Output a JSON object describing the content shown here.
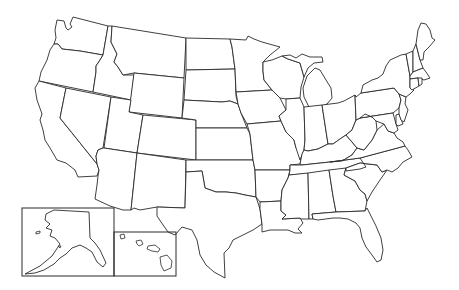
{
  "map": {
    "type": "blank-outline-map",
    "subject": "United States",
    "background_color": "#ffffff",
    "stroke_color": "#2a2a2a",
    "labels_visible": false,
    "insets": [
      {
        "name": "Alaska",
        "frame": [
          22,
          208,
          92,
          68
        ]
      },
      {
        "name": "Hawaii",
        "frame": [
          114,
          232,
          62,
          44
        ]
      }
    ],
    "states": [
      "Washington",
      "Oregon",
      "California",
      "Idaho",
      "Nevada",
      "Montana",
      "Wyoming",
      "Utah",
      "Arizona",
      "Colorado",
      "New Mexico",
      "North Dakota",
      "South Dakota",
      "Nebraska",
      "Kansas",
      "Oklahoma",
      "Texas",
      "Minnesota",
      "Iowa",
      "Missouri",
      "Arkansas",
      "Louisiana",
      "Wisconsin",
      "Illinois",
      "Michigan",
      "Indiana",
      "Ohio",
      "Kentucky",
      "Tennessee",
      "Mississippi",
      "Alabama",
      "Georgia",
      "Florida",
      "South Carolina",
      "North Carolina",
      "Virginia",
      "West Virginia",
      "Maryland",
      "Delaware",
      "Pennsylvania",
      "New Jersey",
      "New York",
      "Connecticut",
      "Rhode Island",
      "Massachusetts",
      "Vermont",
      "New Hampshire",
      "Maine",
      "Alaska",
      "Hawaii"
    ]
  }
}
